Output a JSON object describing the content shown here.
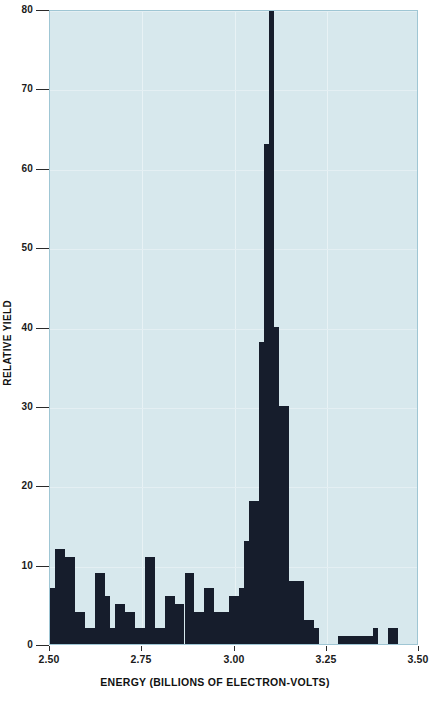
{
  "chart_data": {
    "type": "bar",
    "title": "",
    "subtitle": "",
    "xlabel": "ENERGY (BILLIONS OF ELECTRON-VOLTS)",
    "ylabel": "RELATIVE YIELD",
    "xlim": [
      2.5,
      3.5
    ],
    "ylim": [
      0,
      80
    ],
    "xticks": [
      "2.50",
      "2.75",
      "3.00",
      "3.25",
      "3.50"
    ],
    "xtick_values": [
      2.5,
      2.75,
      3.0,
      3.25,
      3.5
    ],
    "yticks": [
      "0",
      "10",
      "20",
      "30",
      "40",
      "50",
      "60",
      "70",
      "80"
    ],
    "ytick_values": [
      0,
      10,
      20,
      30,
      40,
      50,
      60,
      70,
      80
    ],
    "grid": true,
    "legend": "none",
    "bar_color": "#161d2c",
    "plot_background": "#d7e8ed",
    "bin_width": 0.0135,
    "annotations": [
      "Tall central peak near 3.10 GeV exceeds the top of the plotted range (clipped at 80)"
    ],
    "bins": [
      {
        "x": 2.5,
        "value": 7
      },
      {
        "x": 2.5135,
        "value": 12
      },
      {
        "x": 2.527,
        "value": 12
      },
      {
        "x": 2.5405,
        "value": 11
      },
      {
        "x": 2.554,
        "value": 11
      },
      {
        "x": 2.5675,
        "value": 4
      },
      {
        "x": 2.581,
        "value": 4
      },
      {
        "x": 2.5945,
        "value": 2
      },
      {
        "x": 2.608,
        "value": 2
      },
      {
        "x": 2.6215,
        "value": 9
      },
      {
        "x": 2.635,
        "value": 9
      },
      {
        "x": 2.6485,
        "value": 6
      },
      {
        "x": 2.662,
        "value": 2
      },
      {
        "x": 2.6755,
        "value": 5
      },
      {
        "x": 2.689,
        "value": 5
      },
      {
        "x": 2.7025,
        "value": 4
      },
      {
        "x": 2.716,
        "value": 4
      },
      {
        "x": 2.7295,
        "value": 2
      },
      {
        "x": 2.743,
        "value": 2
      },
      {
        "x": 2.7565,
        "value": 11
      },
      {
        "x": 2.77,
        "value": 11
      },
      {
        "x": 2.7835,
        "value": 2
      },
      {
        "x": 2.797,
        "value": 2
      },
      {
        "x": 2.8105,
        "value": 6
      },
      {
        "x": 2.824,
        "value": 6
      },
      {
        "x": 2.8375,
        "value": 5
      },
      {
        "x": 2.851,
        "value": 5
      },
      {
        "x": 2.8645,
        "value": 9
      },
      {
        "x": 2.878,
        "value": 9
      },
      {
        "x": 2.8915,
        "value": 4
      },
      {
        "x": 2.905,
        "value": 4
      },
      {
        "x": 2.9185,
        "value": 7
      },
      {
        "x": 2.932,
        "value": 7
      },
      {
        "x": 2.9455,
        "value": 4
      },
      {
        "x": 2.959,
        "value": 4
      },
      {
        "x": 2.9725,
        "value": 4
      },
      {
        "x": 2.986,
        "value": 6
      },
      {
        "x": 2.9995,
        "value": 6
      },
      {
        "x": 3.013,
        "value": 7
      },
      {
        "x": 3.0265,
        "value": 13
      },
      {
        "x": 3.04,
        "value": 18
      },
      {
        "x": 3.0535,
        "value": 18
      },
      {
        "x": 3.067,
        "value": 38
      },
      {
        "x": 3.0805,
        "value": 63
      },
      {
        "x": 3.094,
        "value": 95
      },
      {
        "x": 3.1075,
        "value": 40
      },
      {
        "x": 3.121,
        "value": 30
      },
      {
        "x": 3.1345,
        "value": 30
      },
      {
        "x": 3.148,
        "value": 8
      },
      {
        "x": 3.1615,
        "value": 8
      },
      {
        "x": 3.175,
        "value": 8
      },
      {
        "x": 3.1885,
        "value": 3
      },
      {
        "x": 3.202,
        "value": 3
      },
      {
        "x": 3.2155,
        "value": 2
      },
      {
        "x": 3.28,
        "value": 1
      },
      {
        "x": 3.2935,
        "value": 1
      },
      {
        "x": 3.307,
        "value": 1
      },
      {
        "x": 3.3205,
        "value": 1
      },
      {
        "x": 3.334,
        "value": 1
      },
      {
        "x": 3.3475,
        "value": 1
      },
      {
        "x": 3.361,
        "value": 1
      },
      {
        "x": 3.3745,
        "value": 2
      },
      {
        "x": 3.415,
        "value": 2
      },
      {
        "x": 3.4285,
        "value": 2
      }
    ]
  },
  "axes": {
    "y_title": "RELATIVE YIELD",
    "x_title": "ENERGY (BILLIONS OF ELECTRON-VOLTS)"
  }
}
